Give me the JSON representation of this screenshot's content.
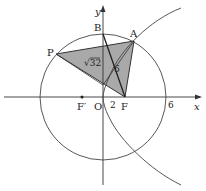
{
  "diagram": {
    "axes": {
      "x_label": "x",
      "y_label": "y"
    },
    "points": {
      "O": "O",
      "F": "F",
      "F_prime": "F′",
      "A": "A",
      "B": "B",
      "P": "P"
    },
    "tick_labels": {
      "two": "2",
      "six": "6"
    },
    "segment_labels": {
      "BF": "6",
      "PF": "√32"
    },
    "colors": {
      "shade": "#a9a9a9",
      "line": "#333333"
    },
    "circle": {
      "center": "O",
      "radius": 6
    },
    "parabola": {
      "focus": "F",
      "focus_x": 2
    }
  }
}
